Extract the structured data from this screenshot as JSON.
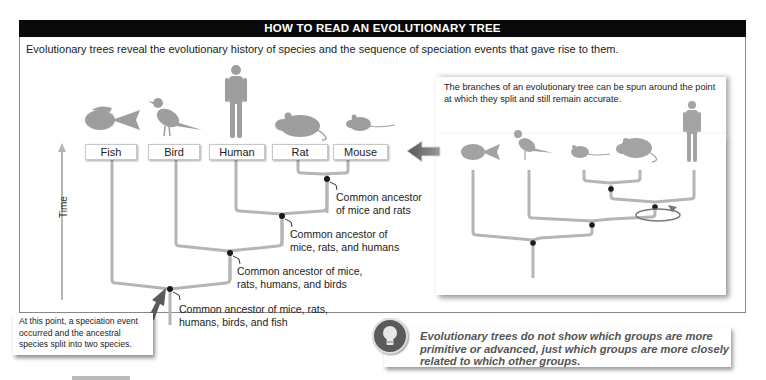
{
  "header": {
    "title": "HOW TO READ AN EVOLUTIONARY TREE"
  },
  "intro": "Evolutionary trees reveal the evolutionary history of species and the sequence of speciation events that gave rise to them.",
  "main_tree": {
    "axis_label": "Time",
    "taxa": [
      {
        "label": "Fish",
        "icon": "fish-icon"
      },
      {
        "label": "Bird",
        "icon": "bird-icon"
      },
      {
        "label": "Human",
        "icon": "human-icon"
      },
      {
        "label": "Rat",
        "icon": "rat-icon"
      },
      {
        "label": "Mouse",
        "icon": "mouse-icon"
      }
    ],
    "nodes": [
      {
        "label_line1": "Common ancestor",
        "label_line2": "of mice and rats"
      },
      {
        "label_line1": "Common ancestor of",
        "label_line2": "mice, rats, and humans"
      },
      {
        "label_line1": "Common ancestor of mice,",
        "label_line2": "rats, humans, and birds"
      },
      {
        "label_line1": "Common ancestor of mice, rats,",
        "label_line2": "humans, birds, and fish"
      }
    ],
    "callout": {
      "line1": "At this point, a speciation event",
      "line2": "occurred and the ancestral",
      "line3": "species split into two species."
    }
  },
  "rotated_tree": {
    "note_line1": "The branches of an evolutionary tree can be spun around the point",
    "note_line2": "at which they split and still remain accurate.",
    "taxa_order": [
      "fish-icon",
      "bird-icon",
      "mouse-icon",
      "rat-icon",
      "human-icon"
    ]
  },
  "tip": {
    "icon": "lightbulb-icon",
    "line1": "Evolutionary trees do not show which groups are more",
    "line2": "primitive or advanced, just which groups are more closely",
    "line3": "related to which other groups."
  },
  "colors": {
    "header_bg": "#0a0a0a",
    "branch": "#b5b5b5",
    "silhouette": "#9e9e9e",
    "node": "#1a1a1a",
    "tip_text": "#555555"
  }
}
